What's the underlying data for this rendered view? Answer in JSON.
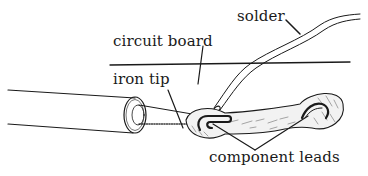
{
  "diagram": {
    "labels": {
      "solder": "solder",
      "circuit_board": "circuit board",
      "iron_tip": "iron tip",
      "component_leads": "component leads"
    },
    "parts": [
      "soldering iron",
      "iron tip",
      "solder wire",
      "circuit board surface",
      "solder pads",
      "component leads"
    ],
    "colors": {
      "ink": "#1a1a1a",
      "background": "#ffffff",
      "pad_fill": "#f2f2f2"
    }
  }
}
